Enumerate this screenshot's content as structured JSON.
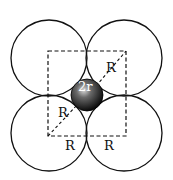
{
  "diagram": {
    "type": "packing-void",
    "large_spheres": [
      {
        "cx": 49,
        "cy": 58,
        "r": 38
      },
      {
        "cx": 124,
        "cy": 58,
        "r": 38
      },
      {
        "cx": 49,
        "cy": 133,
        "r": 38
      },
      {
        "cx": 124,
        "cy": 133,
        "r": 38
      }
    ],
    "void_sphere": {
      "cx": 87,
      "cy": 95,
      "r": 16,
      "label": "2r"
    },
    "labels": {
      "upper_diag": "R",
      "lower_diag": "R",
      "bottom_left": "R",
      "bottom_right": "R"
    },
    "colors": {
      "line": "#111111",
      "background": "#ffffff"
    }
  }
}
